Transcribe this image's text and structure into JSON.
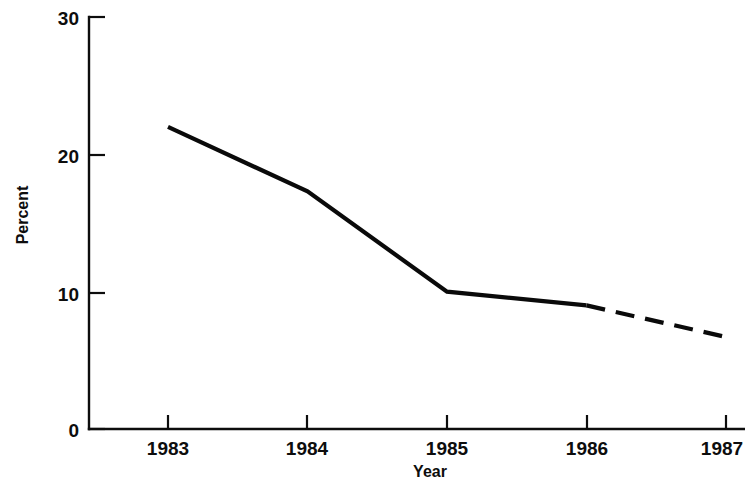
{
  "chart_data": {
    "type": "line",
    "title": "",
    "subtitle": "",
    "xlabel": "Year",
    "ylabel": "Percent",
    "x": [
      1983,
      1984,
      1985,
      1986,
      1987
    ],
    "categories": [
      "1983",
      "1984",
      "1985",
      "1986",
      "1987"
    ],
    "values": [
      22,
      17.3,
      10,
      9,
      6.7
    ],
    "series": [
      {
        "name": "Percent",
        "values": [
          22,
          17.3,
          10,
          9,
          6.7
        ],
        "style": "solid-with-dashed-projection",
        "solid_range": [
          "1983",
          "1986"
        ],
        "dashed_range": [
          "1986",
          "1987"
        ],
        "color": "#0a0a0a"
      }
    ],
    "xlim": [
      1983,
      1987
    ],
    "ylim": [
      0,
      30
    ],
    "ytick_values": [
      0,
      10,
      20,
      30
    ],
    "ytick_labels": [
      "0",
      "10",
      "20",
      "30"
    ],
    "xtick_labels": [
      "1983",
      "1984",
      "1985",
      "1986",
      "1987"
    ],
    "grid": false,
    "legend": null,
    "annotations": []
  },
  "axes": {
    "y": {
      "title": "Percent",
      "ticks": [
        {
          "label": "30",
          "value": 30
        },
        {
          "label": "20",
          "value": 20
        },
        {
          "label": "10",
          "value": 10
        },
        {
          "label": "0",
          "value": 0
        }
      ]
    },
    "x": {
      "title": "Year",
      "ticks": [
        {
          "label": "1983",
          "value": 1983
        },
        {
          "label": "1984",
          "value": 1984
        },
        {
          "label": "1985",
          "value": 1985
        },
        {
          "label": "1986",
          "value": 1986
        },
        {
          "label": "1987",
          "value": 1987
        }
      ]
    }
  },
  "style": {
    "line_color": "#0a0a0a",
    "axis_color": "#0d0d0d",
    "background": "#ffffff"
  }
}
